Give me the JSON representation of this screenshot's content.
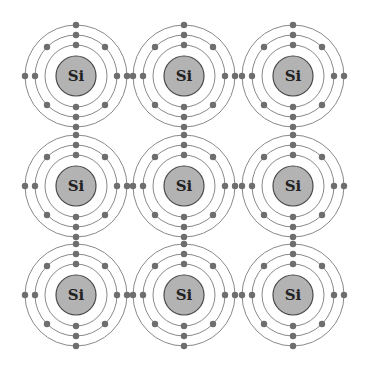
{
  "diagram": {
    "title": "",
    "element_symbol": "Si",
    "grid": {
      "rows": 3,
      "cols": 3
    },
    "column_x": [
      76,
      184,
      293
    ],
    "row_y": [
      76,
      186,
      295
    ],
    "nucleus_radius": 20,
    "shells": [
      {
        "name": "inner",
        "radius": 31,
        "electrons": 2,
        "angles_deg": [
          270,
          90
        ]
      },
      {
        "name": "middle",
        "radius": 41,
        "electrons": 8,
        "angles_deg": [
          0,
          45,
          90,
          135,
          180,
          225,
          270,
          315
        ]
      },
      {
        "name": "outer",
        "radius": 51,
        "electrons": 4,
        "angles_deg": [
          0,
          90,
          180,
          270
        ]
      }
    ],
    "electron_radius": 3.2,
    "colors": {
      "background": "#ffffff",
      "shell_stroke": "#8a8a8a",
      "electron": "#6e6e6e",
      "nucleus_fill": "#b3b3b3",
      "nucleus_stroke": "#4a4a4a",
      "symbol": "#222222"
    },
    "atoms": [
      {
        "label": "Si",
        "row": 0,
        "col": 0
      },
      {
        "label": "Si",
        "row": 0,
        "col": 1
      },
      {
        "label": "Si",
        "row": 0,
        "col": 2
      },
      {
        "label": "Si",
        "row": 1,
        "col": 0
      },
      {
        "label": "Si",
        "row": 1,
        "col": 1
      },
      {
        "label": "Si",
        "row": 1,
        "col": 2
      },
      {
        "label": "Si",
        "row": 2,
        "col": 0
      },
      {
        "label": "Si",
        "row": 2,
        "col": 1
      },
      {
        "label": "Si",
        "row": 2,
        "col": 2
      }
    ]
  }
}
